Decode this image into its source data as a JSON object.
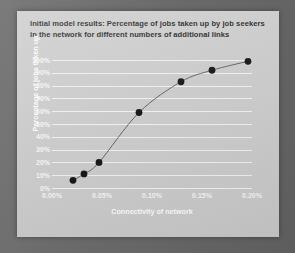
{
  "slide": {
    "title": "Initial model results: Percentage of jobs taken up by job seekers in the network for different numbers of additional links",
    "background_color": "#c9c9c9",
    "backdrop_color": "#6e6e6e"
  },
  "chart_data": {
    "type": "scatter",
    "title": "Initial model results: Percentage of jobs taken up by job seekers in the network for different numbers of additional links",
    "xlabel": "Connectivity of network",
    "ylabel": "Percentage of jobs taken up",
    "xlim": [
      0.0,
      0.2
    ],
    "ylim": [
      0,
      100
    ],
    "grid": true,
    "legend": "none",
    "x_tick_labels": [
      "0.00%",
      "0.05%",
      "0.10%",
      "0.15%",
      "0.20%"
    ],
    "x_tick_values": [
      0.0,
      0.05,
      0.1,
      0.15,
      0.2
    ],
    "y_tick_labels": [
      "0%",
      "10%",
      "20%",
      "30%",
      "40%",
      "50%",
      "60%",
      "70%",
      "80%",
      "90%",
      "100%"
    ],
    "y_tick_values": [
      0,
      10,
      20,
      30,
      40,
      50,
      60,
      70,
      80,
      90,
      100
    ],
    "marker_color": "#111111",
    "line_color": "#555555",
    "gridline_color": "#eeeeee",
    "label_color": "#f4f4f4",
    "x": [
      0.021,
      0.032,
      0.047,
      0.087,
      0.129,
      0.16,
      0.196
    ],
    "values": [
      6,
      11,
      20,
      59,
      83,
      92,
      99
    ],
    "points": [
      {
        "x": 0.021,
        "y": 6
      },
      {
        "x": 0.032,
        "y": 11
      },
      {
        "x": 0.047,
        "y": 20
      },
      {
        "x": 0.087,
        "y": 59
      },
      {
        "x": 0.129,
        "y": 83
      },
      {
        "x": 0.16,
        "y": 92
      },
      {
        "x": 0.196,
        "y": 99
      }
    ]
  }
}
